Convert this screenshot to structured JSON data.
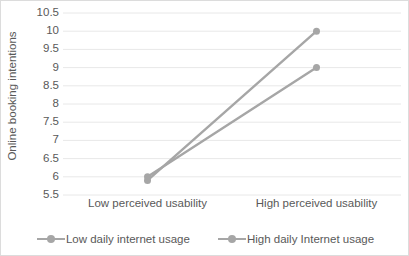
{
  "chart_data": {
    "type": "line",
    "title": "",
    "subtitle": "",
    "xlabel": "",
    "ylabel": "Online booking intentions",
    "categories": [
      "Low perceived usability",
      "High perceived usability"
    ],
    "series": [
      {
        "name": "Low daily internet usage",
        "values": [
          6.0,
          9.0
        ],
        "color": "#a6a6a6"
      },
      {
        "name": "High daily Internet usage",
        "values": [
          5.9,
          10.0
        ],
        "color": "#a6a6a6"
      }
    ],
    "ylim": [
      5.5,
      10.5
    ],
    "ytick_values": [
      5.5,
      6,
      6.5,
      7,
      7.5,
      8,
      8.5,
      9,
      9.5,
      10,
      10.5
    ],
    "ytick_labels": [
      "5.5",
      "6",
      "6.5",
      "7",
      "7.5",
      "8",
      "8.5",
      "9",
      "9.5",
      "10",
      "10.5"
    ],
    "grid": {
      "horizontal": true,
      "vertical": false,
      "color": "#e8e8e8"
    },
    "legend": {
      "position": "bottom",
      "entries": [
        "Low daily internet usage",
        "High daily Internet usage"
      ]
    },
    "marker": {
      "shape": "circle",
      "size": 7
    },
    "plot_border_color": "#dcdcdc",
    "text_color": "#595959"
  }
}
